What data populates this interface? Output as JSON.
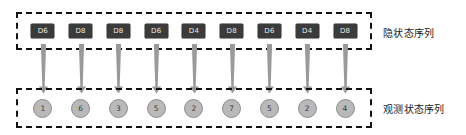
{
  "diagram": {
    "type": "hidden-markov-model-sequence",
    "hidden_layer": {
      "caption": "隐状态序列",
      "nodes": [
        {
          "label": "D6"
        },
        {
          "label": "D8"
        },
        {
          "label": "D8"
        },
        {
          "label": "D6"
        },
        {
          "label": "D4"
        },
        {
          "label": "D8"
        },
        {
          "label": "D6"
        },
        {
          "label": "D4"
        },
        {
          "label": "D8"
        }
      ],
      "node_fill": "#3b3b3b",
      "node_text_color": "#e8e8e8",
      "border_style": "dashed",
      "border_color": "#131313"
    },
    "observed_layer": {
      "caption": "观测状态序列",
      "nodes": [
        {
          "label": "1"
        },
        {
          "label": "6"
        },
        {
          "label": "3"
        },
        {
          "label": "5"
        },
        {
          "label": "2"
        },
        {
          "label": "7"
        },
        {
          "label": "5"
        },
        {
          "label": "2"
        },
        {
          "label": "4"
        }
      ],
      "node_fill": "#b9b9b9",
      "node_border_color": "#8c8c8c",
      "node_text_color": "#3a3a3a",
      "border_style": "dashed",
      "border_color": "#131313"
    },
    "emissions": {
      "count": 9,
      "direction": "down",
      "color": "#9a9a9a",
      "arrows": [
        {
          "from": "D6",
          "to": "1"
        },
        {
          "from": "D8",
          "to": "6"
        },
        {
          "from": "D8",
          "to": "3"
        },
        {
          "from": "D6",
          "to": "5"
        },
        {
          "from": "D4",
          "to": "2"
        },
        {
          "from": "D8",
          "to": "7"
        },
        {
          "from": "D6",
          "to": "5"
        },
        {
          "from": "D4",
          "to": "2"
        },
        {
          "from": "D8",
          "to": "4"
        }
      ]
    },
    "background": "#ffffff"
  }
}
